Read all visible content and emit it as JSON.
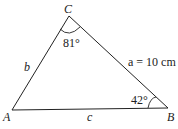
{
  "diagram": {
    "type": "triangle",
    "vertices": {
      "A": "A",
      "B": "B",
      "C": "C"
    },
    "sides": {
      "a": "a = 10 cm",
      "b": "b",
      "c": "c"
    },
    "angles": {
      "C": "81°",
      "B": "42°"
    },
    "colors": {
      "stroke": "#222222",
      "background": "#ffffff"
    }
  }
}
